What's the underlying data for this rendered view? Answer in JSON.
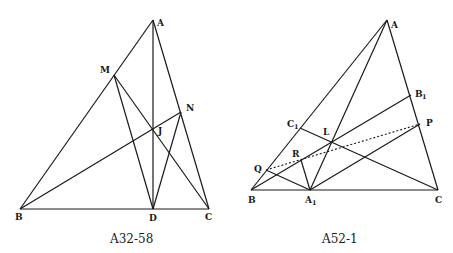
{
  "figures": [
    {
      "id": "left",
      "caption": "A32-58",
      "points": {
        "A": {
          "label": "A",
          "x": 153,
          "y": 20
        },
        "M": {
          "label": "M",
          "x": 114,
          "y": 75
        },
        "N": {
          "label": "N",
          "x": 181,
          "y": 112
        },
        "J": {
          "label": "J",
          "x": 153,
          "y": 129
        },
        "B": {
          "label": "B",
          "x": 20,
          "y": 209
        },
        "D": {
          "label": "D",
          "x": 153,
          "y": 209
        },
        "C": {
          "label": "C",
          "x": 209,
          "y": 209
        }
      },
      "segments": [
        [
          "A",
          "B"
        ],
        [
          "B",
          "C"
        ],
        [
          "A",
          "C"
        ],
        [
          "A",
          "D"
        ],
        [
          "B",
          "N"
        ],
        [
          "M",
          "C"
        ],
        [
          "M",
          "D"
        ],
        [
          "N",
          "D"
        ]
      ]
    },
    {
      "id": "right",
      "caption": "A52-1",
      "points": {
        "A": {
          "label": "A",
          "x": 387,
          "y": 20
        },
        "B1": {
          "label": "B",
          "sub": "1",
          "x": 411,
          "y": 95
        },
        "P": {
          "label": "P",
          "x": 420,
          "y": 124
        },
        "C1": {
          "label": "C",
          "sub": "1",
          "x": 300,
          "y": 128
        },
        "L": {
          "label": "L",
          "x": 332,
          "y": 141
        },
        "R": {
          "label": "R",
          "x": 301,
          "y": 160
        },
        "Q": {
          "label": "Q",
          "x": 266,
          "y": 170
        },
        "B": {
          "label": "B",
          "x": 251,
          "y": 190
        },
        "A1": {
          "label": "A",
          "sub": "1",
          "x": 310,
          "y": 190
        },
        "C": {
          "label": "C",
          "x": 438,
          "y": 190
        }
      },
      "segments": [
        [
          "A",
          "B"
        ],
        [
          "B",
          "C"
        ],
        [
          "A",
          "C"
        ],
        [
          "A",
          "A1"
        ],
        [
          "B",
          "B1"
        ],
        [
          "C",
          "C1"
        ],
        [
          "Q",
          "A1"
        ],
        [
          "R",
          "A1"
        ],
        [
          "A1",
          "P"
        ]
      ],
      "dotted_segments": [
        [
          "Q",
          "P"
        ]
      ]
    }
  ]
}
